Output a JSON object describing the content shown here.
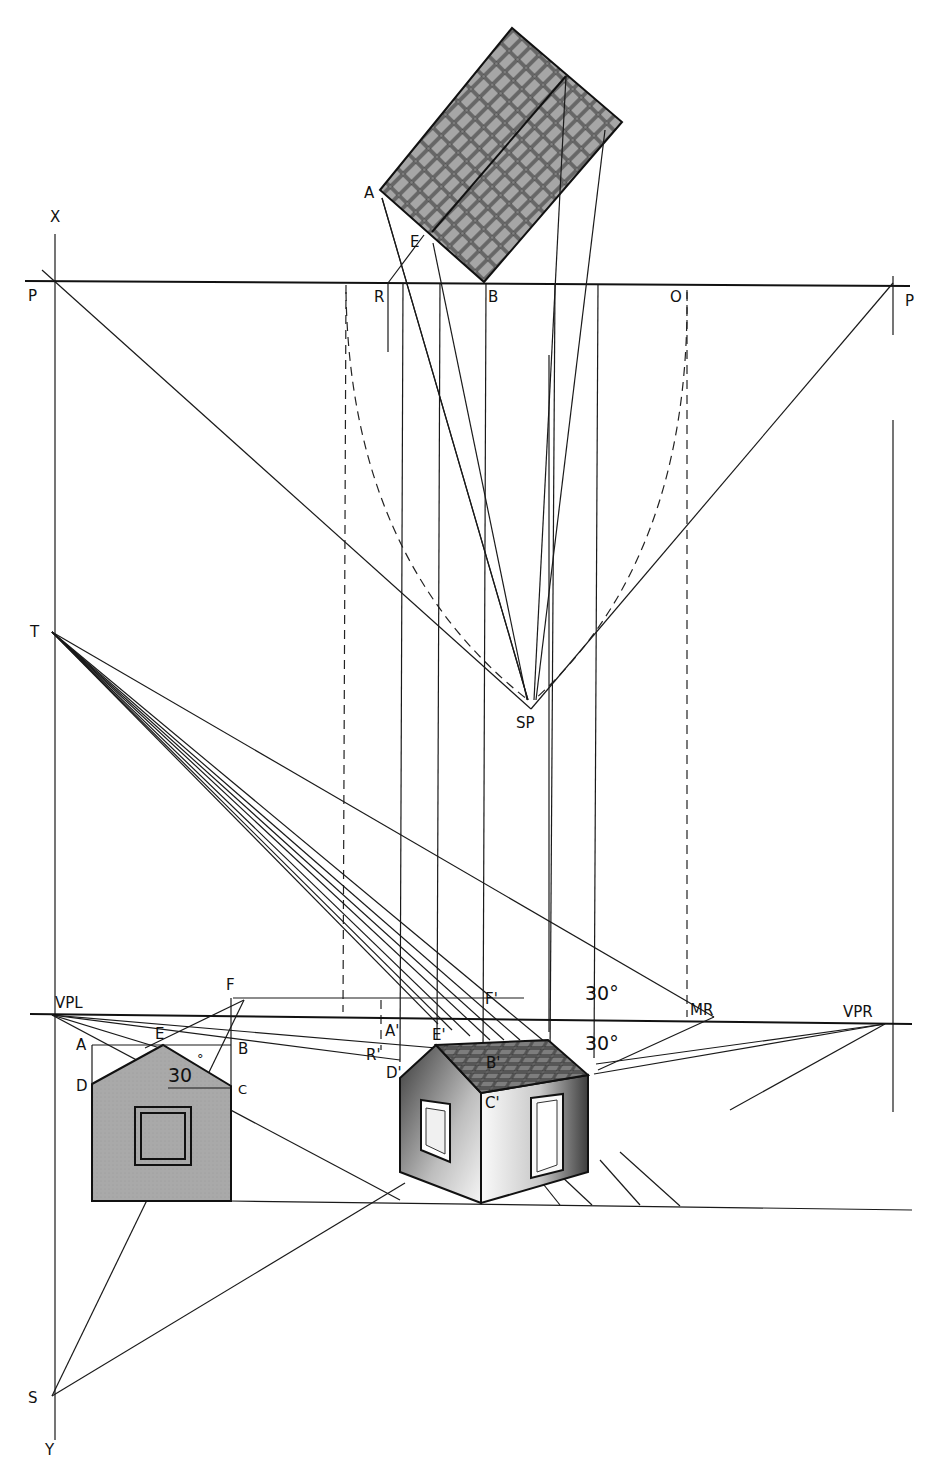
{
  "diagram": {
    "labels": {
      "x_axis_top": "X",
      "y_axis_bottom": "Y",
      "picture_plane_left": "P",
      "picture_plane_right": "P",
      "plan_corner_a": "A",
      "plan_point_e": "E",
      "plan_point_r": "R",
      "plan_point_b": "B",
      "plan_point_o": "O",
      "station_point": "SP",
      "point_t": "T",
      "point_s": "S",
      "vanishing_point_left": "VPL",
      "vanishing_point_right": "VPR",
      "measuring_point_right": "MR",
      "elev_f": "F",
      "elev_e": "E",
      "elev_a": "A",
      "elev_b": "B",
      "elev_d": "D",
      "elev_c": "C",
      "elev_angle": "30",
      "elev_degree": "°",
      "persp_f": "F'",
      "persp_a": "A'",
      "persp_e": "E'",
      "persp_r": "R'",
      "persp_b": "B'",
      "persp_d": "D'",
      "persp_c": "C'",
      "angle_upper": "30°",
      "angle_lower": "30°"
    },
    "colors": {
      "line": "#1a1a1a",
      "roof_fill": "#9a9a9a",
      "elevation_fill": "#a8a8a8",
      "wall_dark": "#555555",
      "wall_light": "#f2f2f2",
      "background": "#ffffff"
    }
  }
}
